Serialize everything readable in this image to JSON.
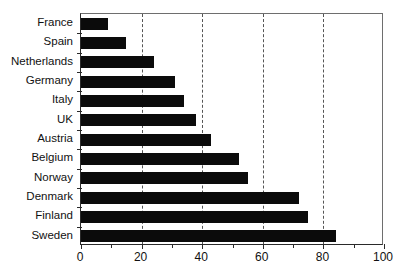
{
  "chart_data": {
    "type": "bar",
    "orientation": "horizontal",
    "title": "",
    "subtitle": "",
    "xlabel": "",
    "ylabel": "",
    "categories": [
      "France",
      "Spain",
      "Netherlands",
      "Germany",
      "Italy",
      "UK",
      "Austria",
      "Belgium",
      "Norway",
      "Denmark",
      "Finland",
      "Sweden"
    ],
    "values": [
      9,
      15,
      24,
      31,
      34,
      38,
      43,
      52,
      55,
      72,
      75,
      84
    ],
    "xlim": [
      0,
      100
    ],
    "xticks": [
      0,
      20,
      40,
      60,
      80,
      100
    ],
    "xtick_labels": [
      "0",
      "20",
      "40",
      "60",
      "80",
      "100"
    ],
    "xticks_minor": [
      10,
      30,
      50,
      70,
      90
    ],
    "grid": {
      "vertical": true,
      "horizontal": false,
      "style": "dashed",
      "at": [
        20,
        40,
        60,
        80
      ]
    },
    "legend": null,
    "bar_color": "#0b0b0b",
    "axis_color": "#2a2a2a",
    "grid_color": "#555555",
    "background": "#ffffff"
  }
}
